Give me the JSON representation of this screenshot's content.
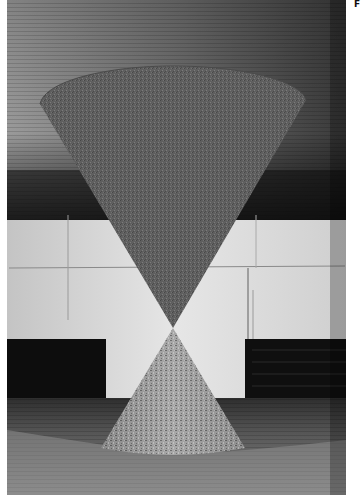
{
  "page": {
    "corner_label": "F"
  },
  "photo": {
    "description": "Black-and-white photograph of an hourglass-shaped installation: an inverted cone suspended from a wooden ceiling touching the tip of a cone resting on a wooden floor, in a room with white walls and dark panels",
    "colors": {
      "ceiling": "#6b6b6b",
      "ceiling_light": "#9a9a9a",
      "ceiling_dark": "#1c1c1c",
      "upper_cone": "#606060",
      "wall": "#d8d8d8",
      "panel": "#0e0e0e",
      "lower_cone": "#9c9c9c",
      "floor": "#7a7a7a",
      "floor_shadow": "#3a3a3a"
    }
  }
}
